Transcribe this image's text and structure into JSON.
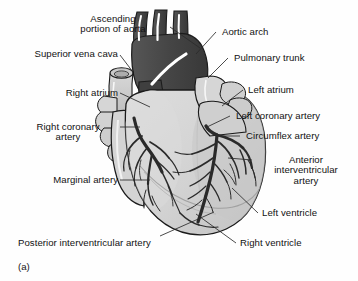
{
  "figure": {
    "caption": "(a)",
    "colors": {
      "background": "#fefefe",
      "myocardium_fill": "#d2d2d2",
      "aorta_dark": "#4a4a4a",
      "vessel_dark": "#2c2c2c",
      "outline": "#1a1a1a",
      "leader_line": "#2b2b2b",
      "highlight": "#ffffff",
      "text": "#121212"
    }
  },
  "labels_left": [
    {
      "id": "ascending-aorta",
      "lines": [
        "Ascending",
        "portion of aorta"
      ],
      "align": "center",
      "x": 58,
      "y": 14,
      "w": 110
    },
    {
      "id": "superior-vena-cava",
      "lines": [
        "Superior vena cava"
      ],
      "align": "right",
      "x": 8,
      "y": 49,
      "w": 110
    },
    {
      "id": "right-atrium",
      "lines": [
        "Right atrium"
      ],
      "align": "right",
      "x": 20,
      "y": 88,
      "w": 98
    },
    {
      "id": "right-coronary-artery",
      "lines": [
        "Right coronary",
        "artery"
      ],
      "align": "center",
      "x": 18,
      "y": 122,
      "w": 100
    },
    {
      "id": "marginal-artery",
      "lines": [
        "Marginal artery"
      ],
      "align": "right",
      "x": 14,
      "y": 175,
      "w": 104
    },
    {
      "id": "posterior-interventricular-artery",
      "lines": [
        "Posterior interventricular artery"
      ],
      "align": "left",
      "x": 18,
      "y": 238,
      "w": 180
    }
  ],
  "labels_right": [
    {
      "id": "aortic-arch",
      "lines": [
        "Aortic arch"
      ],
      "align": "left",
      "x": 222,
      "y": 27,
      "w": 110
    },
    {
      "id": "pulmonary-trunk",
      "lines": [
        "Pulmonary trunk"
      ],
      "align": "left",
      "x": 234,
      "y": 53,
      "w": 116
    },
    {
      "id": "left-atrium",
      "lines": [
        "Left atrium"
      ],
      "align": "left",
      "x": 248,
      "y": 85,
      "w": 100
    },
    {
      "id": "left-coronary-artery",
      "lines": [
        "Left coronary artery"
      ],
      "align": "left",
      "x": 236,
      "y": 111,
      "w": 120
    },
    {
      "id": "circumflex-artery",
      "lines": [
        "Circumflex artery"
      ],
      "align": "left",
      "x": 246,
      "y": 131,
      "w": 112
    },
    {
      "id": "anterior-interventricular-artery",
      "lines": [
        "Anterior",
        "interventricular",
        "artery"
      ],
      "align": "center",
      "x": 256,
      "y": 155,
      "w": 98
    },
    {
      "id": "left-ventricle",
      "lines": [
        "Left ventricle"
      ],
      "align": "left",
      "x": 262,
      "y": 208,
      "w": 96
    },
    {
      "id": "right-ventricle",
      "lines": [
        "Right ventricle"
      ],
      "align": "left",
      "x": 240,
      "y": 238,
      "w": 104
    }
  ]
}
